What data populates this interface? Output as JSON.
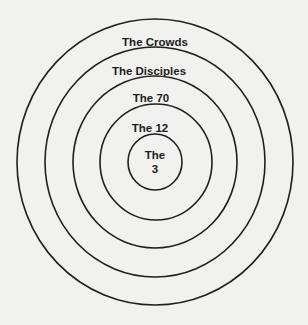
{
  "diagram": {
    "type": "concentric-circles",
    "background_color": "#f1f1ef",
    "line_color": "#1f1f1f",
    "rings": [
      {
        "label": "The Crowds"
      },
      {
        "label": "The Disciples"
      },
      {
        "label": "The 70"
      },
      {
        "label": "The 12"
      },
      {
        "label_line1": "The",
        "label_line2": "3"
      }
    ]
  }
}
